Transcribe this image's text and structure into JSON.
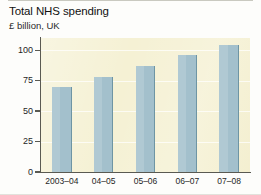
{
  "chart_data": {
    "type": "bar",
    "title": "Total NHS spending",
    "subtitle": "£ billion, UK",
    "xlabel": "",
    "ylabel": "",
    "categories": [
      "2003–04",
      "04–05",
      "05–06",
      "06–07",
      "07–08"
    ],
    "values": [
      70,
      78,
      87,
      96,
      104
    ],
    "ylim": [
      0,
      110
    ],
    "yticks": [
      0,
      25,
      50,
      75,
      100
    ],
    "ytick_labels": [
      "0",
      "25",
      "50",
      "75",
      "100"
    ],
    "grid": true,
    "legend": false,
    "series": [
      {
        "name": "Total NHS spending",
        "values": [
          70,
          78,
          87,
          96,
          104
        ]
      }
    ],
    "colors": {
      "bar": "#a3c0cc",
      "bar_edge": "#6e95a4",
      "plot_background": "#f5f1d4",
      "page_background": "#fdfdfb",
      "axis": "#5a5a52",
      "gridline": "#ffffff",
      "text": "#1a1a1a"
    }
  }
}
